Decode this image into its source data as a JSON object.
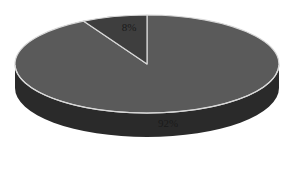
{
  "chart_data": {
    "type": "pie",
    "style": "3d",
    "title": "",
    "slices": [
      {
        "label": "92%",
        "value": 92,
        "color": "#5a5a5a",
        "side_color": "#2a2a2a"
      },
      {
        "label": "8%",
        "value": 8,
        "color": "#3e3e3e",
        "side_color": "#1e1e1e"
      }
    ],
    "legend": "none",
    "separator_color": "#d8d8d8"
  }
}
